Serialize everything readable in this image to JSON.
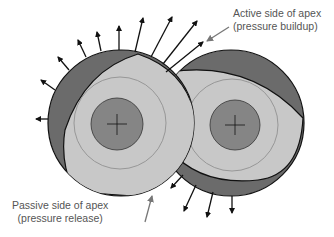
{
  "diagram": {
    "labels": {
      "active": {
        "line1": "Active side of apex",
        "line2": "(pressure buildup)"
      },
      "passive": {
        "line1": "Passive side of apex",
        "line2": "(pressure release)"
      }
    },
    "colors": {
      "outer_dark": "#6b6b6b",
      "lens_light": "#c8c8c8",
      "inner_core": "#858585",
      "stroke": "#111111",
      "thin_ring": "#8a8a8a",
      "pointer": "#777777",
      "text": "#555555"
    },
    "rotors": [
      {
        "name": "left-rotor",
        "cx": 121,
        "cy": 123,
        "r": 73
      },
      {
        "name": "right-rotor",
        "cx": 231,
        "cy": 123,
        "r": 73
      }
    ]
  }
}
